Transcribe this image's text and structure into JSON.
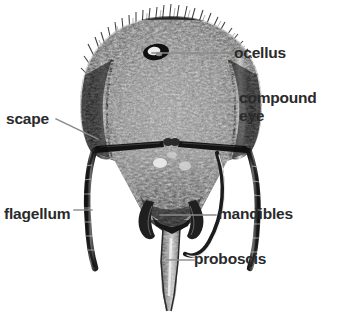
{
  "figure": {
    "background_color": "#ffffff",
    "label_color": "#2a2a2a",
    "leader_color": "#8a8a8a",
    "width": 342,
    "height": 313
  },
  "labels": [
    {
      "id": "ocellus",
      "text": "ocellus"
    },
    {
      "id": "compound-eye",
      "text": "compound\neye"
    },
    {
      "id": "scape",
      "text": "scape"
    },
    {
      "id": "flagellum",
      "text": "flagellum"
    },
    {
      "id": "mandibles",
      "text": "mandibles"
    },
    {
      "id": "proboscis",
      "text": "proboscis"
    }
  ]
}
